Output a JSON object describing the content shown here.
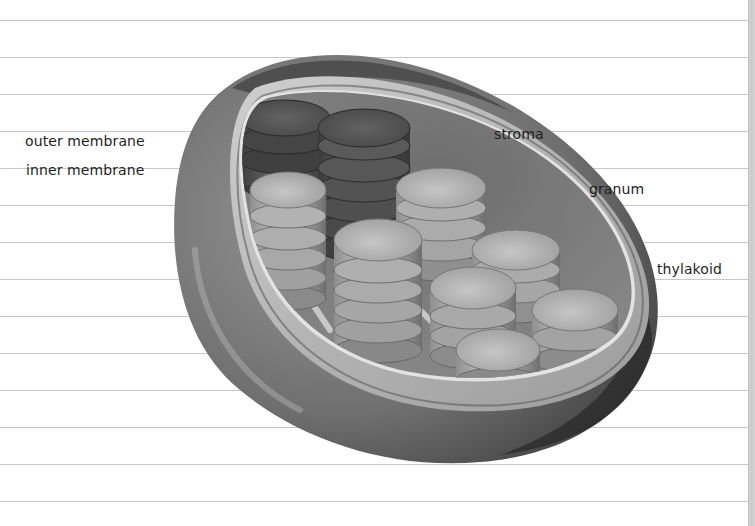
{
  "worksheet": {
    "title": "Chloroplast structure",
    "rule_positions_px": [
      20,
      57,
      94,
      131,
      168,
      205,
      242,
      279,
      316,
      353,
      390,
      427,
      464,
      501
    ],
    "labels": [
      {
        "id": "outer-membrane",
        "text": "outer membrane",
        "x": 25,
        "y": 133
      },
      {
        "id": "inner-membrane",
        "text": "inner membrane",
        "x": 26,
        "y": 162
      },
      {
        "id": "stroma",
        "text": "stroma",
        "x": 494,
        "y": 126
      },
      {
        "id": "granum",
        "text": "granum",
        "x": 589,
        "y": 181
      },
      {
        "id": "thylakoid",
        "text": "thylakoid",
        "x": 657,
        "y": 261
      }
    ]
  },
  "diagram": {
    "style": "grayscale 3D illustration",
    "parts": [
      "outer membrane",
      "inner membrane",
      "stroma",
      "granum",
      "thylakoid"
    ],
    "colors": {
      "outer_membrane": "#5a5a5a",
      "inner_band": "#a9a9a9",
      "stroma": "#7a7a7a",
      "thylakoid_light": "#b8b8b8",
      "thylakoid_dark": "#4a4a4a",
      "rule_line": "#c8c8c8"
    }
  }
}
